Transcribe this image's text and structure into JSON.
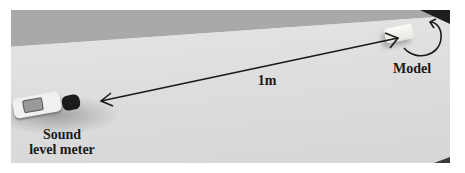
{
  "figure": {
    "labels": {
      "sound_level_meter_line1": "Sound",
      "sound_level_meter_line2": "level meter",
      "model": "Model",
      "distance": "1m"
    },
    "colors": {
      "arrow": "#1a1a1a",
      "text": "#1a1a1a",
      "table": "#dedede",
      "wall": "#a9a9a9"
    }
  }
}
